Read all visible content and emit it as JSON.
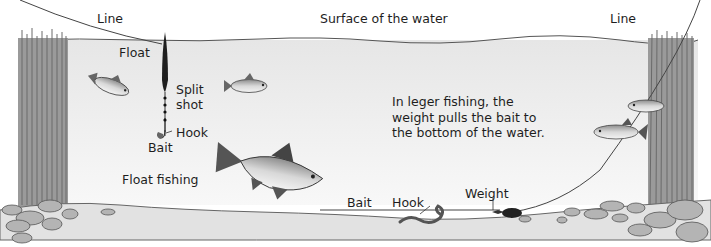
{
  "diagram": {
    "labels": {
      "line_left": "Line",
      "surface": "Surface of the water",
      "line_right": "Line",
      "float": "Float",
      "split_shot_1": "Split",
      "split_shot_2": "shot",
      "hook_float": "Hook",
      "bait_float": "Bait",
      "float_fishing": "Float fishing",
      "bait_leger": "Bait",
      "hook_leger": "Hook",
      "weight": "Weight"
    },
    "note": {
      "line1": "In leger fishing, the",
      "line2": "weight pulls the bait to",
      "line3": "the bottom of the water."
    },
    "colors": {
      "water": "#ececec",
      "reeds": "#8a8a8a",
      "riverbed": "#e4e4e4",
      "stones": "#b4b4b4",
      "line": "#444444"
    }
  }
}
